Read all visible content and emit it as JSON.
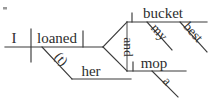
{
  "diagram": {
    "type": "reed-kellogg-sentence-diagram",
    "sentence": "I loaned her my best bucket and a mop.",
    "colors": {
      "line": "#3a3a3a",
      "text": "#2e2e2e",
      "background": "#ffffff"
    },
    "words": {
      "subject": "I",
      "verb": "loaned",
      "indirect_object_marker": "(t)",
      "indirect_object": "her",
      "conjunction": "and",
      "direct_object_1": "bucket",
      "direct_object_1_modifier_1": "my",
      "direct_object_1_modifier_2": "best",
      "direct_object_2": "mop",
      "direct_object_2_modifier_1": "a"
    },
    "labels": {
      "subject_label": "subject",
      "verb_label": "verb",
      "indirect_object_label": "indirect object",
      "direct_object_label": "direct object",
      "conjunction_label": "coordinating conjunction",
      "modifier_label": "modifier"
    }
  }
}
